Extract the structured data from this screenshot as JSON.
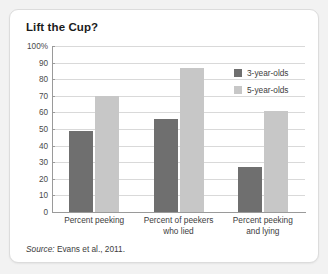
{
  "card": {
    "title": "Lift the Cup?",
    "source_label": "Source:",
    "source_text": "Evans et al., 2011."
  },
  "chart_data": {
    "type": "bar",
    "title": "Lift the Cup?",
    "xlabel": "",
    "ylabel": "",
    "ylim": [
      0,
      100
    ],
    "yticks": [
      0,
      10,
      20,
      30,
      40,
      50,
      60,
      70,
      80,
      90,
      100
    ],
    "ytick_labels": [
      "0",
      "10",
      "20",
      "30",
      "40",
      "50",
      "60",
      "70",
      "80",
      "90",
      "100%"
    ],
    "grid": true,
    "legend_position": "top-right",
    "categories": [
      "Percent peeking",
      "Percent of peekers who lied",
      "Percent peeking and lying"
    ],
    "category_lines": [
      [
        "Percent peeking"
      ],
      [
        "Percent of peekers",
        "who lied"
      ],
      [
        "Percent peeking",
        "and lying"
      ]
    ],
    "series": [
      {
        "name": "3-year-olds",
        "color": "#6f6f6f",
        "values": [
          49,
          56,
          27
        ]
      },
      {
        "name": "5-year-olds",
        "color": "#c7c7c7",
        "values": [
          70,
          87,
          61
        ]
      }
    ],
    "source": "Source: Evans et al., 2011."
  },
  "colors": {
    "bar_3yo": "#6f6f6f",
    "bar_5yo": "#c7c7c7",
    "gridline": "#d9d9d9",
    "axis": "#9a9a9a",
    "card_bg": "#ffffff",
    "page_bg": "#f2f2f2"
  }
}
